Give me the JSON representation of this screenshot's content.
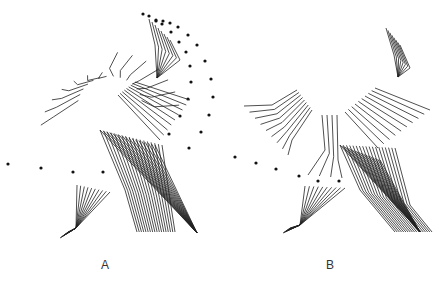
{
  "figure": {
    "panels": [
      {
        "id": "A",
        "label": "A",
        "description": "stick-figure motion trace, trunk/arm/leg segments with marker dots"
      },
      {
        "id": "B",
        "label": "B",
        "description": "stick-figure motion trace, trunk/arm/leg segments with marker dots"
      }
    ],
    "line_color": "#222222",
    "dot_color": "#111111",
    "background": "#ffffff"
  }
}
